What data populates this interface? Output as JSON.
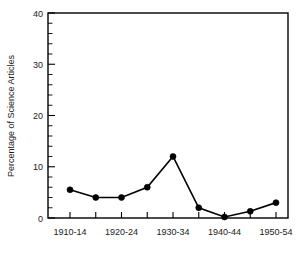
{
  "chart_data": {
    "type": "line",
    "title": "",
    "subtitle": "",
    "xlabel": "",
    "ylabel": "Percentage of Science Articles",
    "categories": [
      "1910-14",
      "1915-19",
      "1920-24",
      "1925-29",
      "1930-34",
      "1935-39",
      "1940-44",
      "1945-49",
      "1950-54"
    ],
    "x_tick_labels": [
      "1910-14",
      "",
      "1920-24",
      "",
      "1930-34",
      "",
      "1940-44",
      "",
      "1950-54"
    ],
    "values": [
      5.5,
      4.0,
      4.0,
      6.0,
      12.0,
      2.0,
      0.2,
      1.3,
      3.0
    ],
    "series": [
      {
        "name": "Percentage of Science Articles",
        "values": [
          5.5,
          4.0,
          4.0,
          6.0,
          12.0,
          2.0,
          0.2,
          1.3,
          3.0
        ]
      }
    ],
    "ylim": [
      0,
      40
    ],
    "y_ticks": [
      0,
      10,
      20,
      30,
      40
    ],
    "y_tick_labels": [
      "0",
      "10",
      "20",
      "30",
      "40"
    ],
    "y_minor_step": 2,
    "grid": false,
    "legend": null,
    "legend_position": "none",
    "marker": "filled-circle",
    "line_color": "#000000",
    "marker_color": "#000000",
    "background_color": "#ffffff",
    "frame": "box"
  },
  "axis": {
    "y_title": "Percentage of Science Articles"
  }
}
